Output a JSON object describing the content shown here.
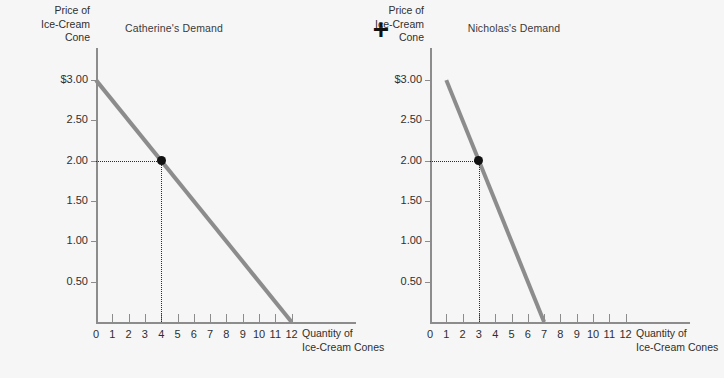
{
  "figure": {
    "operator": "+",
    "background_color": "#f6f6f6",
    "curve_color": "#8c8c8c",
    "axis_color": "#8c8c8c",
    "marker_color": "#111111"
  },
  "panels": [
    {
      "title": "Catherine's Demand",
      "ylabel_lines": [
        "Price of",
        "Ice-Cream",
        "Cone"
      ],
      "xlabel_line1": "Quantity of",
      "xlabel_line2": "Ice-Cream Cones",
      "yticks": [
        "$3.00",
        "2.50",
        "2.00",
        "1.50",
        "1.00",
        "0.50"
      ],
      "xticks": [
        "0",
        "1",
        "2",
        "3",
        "4",
        "5",
        "6",
        "7",
        "8",
        "9",
        "10",
        "11",
        "12"
      ],
      "marked_point": {
        "quantity": 4,
        "price": "2.00"
      }
    },
    {
      "title": "Nicholas's Demand",
      "ylabel_lines": [
        "Price of",
        "Ice-Cream",
        "Cone"
      ],
      "xlabel_line1": "Quantity of",
      "xlabel_line2": "Ice-Cream Cones",
      "yticks": [
        "$3.00",
        "2.50",
        "2.00",
        "1.50",
        "1.00",
        "0.50"
      ],
      "xticks": [
        "0",
        "1",
        "2",
        "3",
        "4",
        "5",
        "6",
        "7",
        "8",
        "9",
        "10",
        "11",
        "12"
      ],
      "marked_point": {
        "quantity": 3,
        "price": "2.00"
      }
    }
  ],
  "chart_data": [
    {
      "type": "line",
      "title": "Catherine's Demand",
      "xlabel": "Quantity of Ice-Cream Cones",
      "ylabel": "Price of Ice-Cream Cone",
      "xlim": [
        0,
        14
      ],
      "ylim": [
        0,
        3.5
      ],
      "xticks": [
        0,
        1,
        2,
        3,
        4,
        5,
        6,
        7,
        8,
        9,
        10,
        11,
        12
      ],
      "yticks": [
        0.5,
        1.0,
        1.5,
        2.0,
        2.5,
        3.0
      ],
      "ytick_labels": [
        "0.50",
        "1.00",
        "1.50",
        "2.00",
        "2.50",
        "$3.00"
      ],
      "grid": false,
      "legend": "none",
      "series": [
        {
          "name": "Catherine's demand curve",
          "x": [
            0,
            12
          ],
          "y": [
            3.0,
            0.0
          ],
          "color": "#8c8c8c"
        }
      ],
      "points": [
        {
          "x": 4,
          "y": 2.0,
          "label": "",
          "style": "filled-circle",
          "color": "#111111"
        }
      ],
      "annotations": [
        {
          "type": "dotted-guide",
          "from": [
            0,
            2.0
          ],
          "to": [
            4,
            2.0
          ]
        },
        {
          "type": "dotted-guide",
          "from": [
            4,
            2.0
          ],
          "to": [
            4,
            0.0
          ]
        }
      ]
    },
    {
      "type": "line",
      "title": "Nicholas's Demand",
      "xlabel": "Quantity of Ice-Cream Cones",
      "ylabel": "Price of Ice-Cream Cone",
      "xlim": [
        0,
        14
      ],
      "ylim": [
        0,
        3.5
      ],
      "xticks": [
        0,
        1,
        2,
        3,
        4,
        5,
        6,
        7,
        8,
        9,
        10,
        11,
        12
      ],
      "yticks": [
        0.5,
        1.0,
        1.5,
        2.0,
        2.5,
        3.0
      ],
      "ytick_labels": [
        "0.50",
        "1.00",
        "1.50",
        "2.00",
        "2.50",
        "$3.00"
      ],
      "grid": false,
      "legend": "none",
      "series": [
        {
          "name": "Nicholas's demand curve",
          "x": [
            1,
            7
          ],
          "y": [
            3.0,
            0.0
          ],
          "color": "#8c8c8c"
        }
      ],
      "points": [
        {
          "x": 3,
          "y": 2.0,
          "label": "",
          "style": "filled-circle",
          "color": "#111111"
        }
      ],
      "annotations": [
        {
          "type": "dotted-guide",
          "from": [
            0,
            2.0
          ],
          "to": [
            3,
            2.0
          ]
        },
        {
          "type": "dotted-guide",
          "from": [
            3,
            2.0
          ],
          "to": [
            3,
            0.0
          ]
        }
      ]
    }
  ]
}
